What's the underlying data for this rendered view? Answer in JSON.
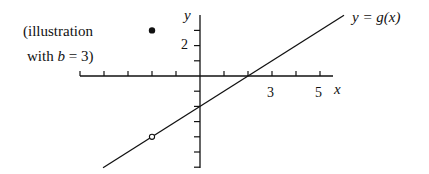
{
  "chart_data": {
    "type": "line",
    "title": "",
    "xlabel": "x",
    "ylabel": "y",
    "xlim": [
      -5,
      6
    ],
    "ylim": [
      -6,
      4
    ],
    "grid": false,
    "x_ticks": [
      -5,
      -4,
      -3,
      -2,
      -1,
      1,
      2,
      3,
      4,
      5
    ],
    "x_tick_labels": [
      {
        "value": 3,
        "label": "3"
      },
      {
        "value": 5,
        "label": "5"
      }
    ],
    "y_ticks": [
      3,
      2,
      1,
      -1,
      -2,
      -3,
      -4,
      -5,
      -6
    ],
    "y_tick_labels": [
      {
        "value": 2,
        "label": "2"
      }
    ],
    "series": [
      {
        "name": "y = g(x)",
        "equation": "g(x) = x - 2",
        "x": [
          -4.04,
          6.0
        ],
        "y": [
          -6.04,
          4.0
        ]
      }
    ],
    "points": [
      {
        "name": "filled-point",
        "x": -2,
        "y": 3,
        "style": "filled"
      },
      {
        "name": "open-point",
        "x": -2,
        "y": -4,
        "style": "open"
      }
    ],
    "annotations": {
      "curve_label": "y = g(x)",
      "note_line1": "(illustration",
      "note_line2_prefix": "with ",
      "note_line2_var": "b",
      "note_line2_suffix": " = 3)"
    }
  }
}
